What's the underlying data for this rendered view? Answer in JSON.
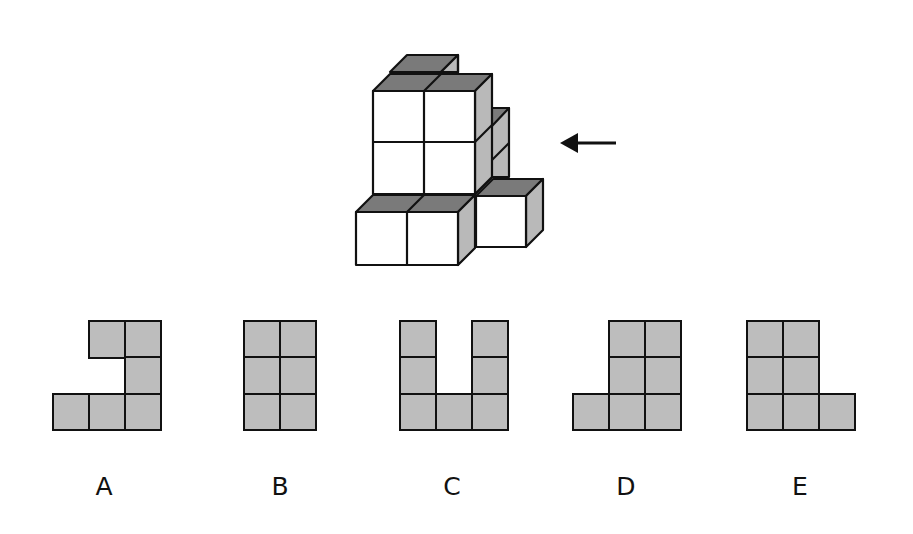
{
  "puzzle": {
    "type": "cube-view-selection",
    "view_direction_arrow": "left-arrow",
    "colors": {
      "front_face": "#ffffff",
      "top_face": "#7a7a7a",
      "side_face": "#b9b9b9",
      "option_fill": "#bdbdbd",
      "stroke": "#111111"
    },
    "figure": {
      "description": "Isometric stack of cubes viewed with arrow pointing from right side"
    },
    "options": [
      {
        "label": "A",
        "cells": [
          [
            0,
            1
          ],
          [
            0,
            2
          ],
          [
            1,
            2
          ],
          [
            2,
            0
          ],
          [
            2,
            1
          ],
          [
            2,
            2
          ]
        ],
        "cols": 3,
        "origin_x": 53
      },
      {
        "label": "B",
        "cells": [
          [
            0,
            0
          ],
          [
            0,
            1
          ],
          [
            1,
            0
          ],
          [
            1,
            1
          ],
          [
            2,
            0
          ],
          [
            2,
            1
          ]
        ],
        "cols": 2,
        "origin_x": 244
      },
      {
        "label": "C",
        "cells": [
          [
            0,
            0
          ],
          [
            0,
            2
          ],
          [
            1,
            0
          ],
          [
            1,
            2
          ],
          [
            2,
            0
          ],
          [
            2,
            1
          ],
          [
            2,
            2
          ]
        ],
        "cols": 3,
        "origin_x": 400
      },
      {
        "label": "D",
        "cells": [
          [
            0,
            1
          ],
          [
            0,
            2
          ],
          [
            1,
            1
          ],
          [
            1,
            2
          ],
          [
            2,
            0
          ],
          [
            2,
            1
          ],
          [
            2,
            2
          ]
        ],
        "cols": 3,
        "origin_x": 573
      },
      {
        "label": "E",
        "cells": [
          [
            0,
            0
          ],
          [
            0,
            1
          ],
          [
            1,
            0
          ],
          [
            1,
            1
          ],
          [
            2,
            0
          ],
          [
            2,
            1
          ],
          [
            2,
            2
          ]
        ],
        "cols": 3,
        "origin_x": 747
      }
    ],
    "labels": {
      "A": "A",
      "B": "B",
      "C": "C",
      "D": "D",
      "E": "E"
    }
  }
}
